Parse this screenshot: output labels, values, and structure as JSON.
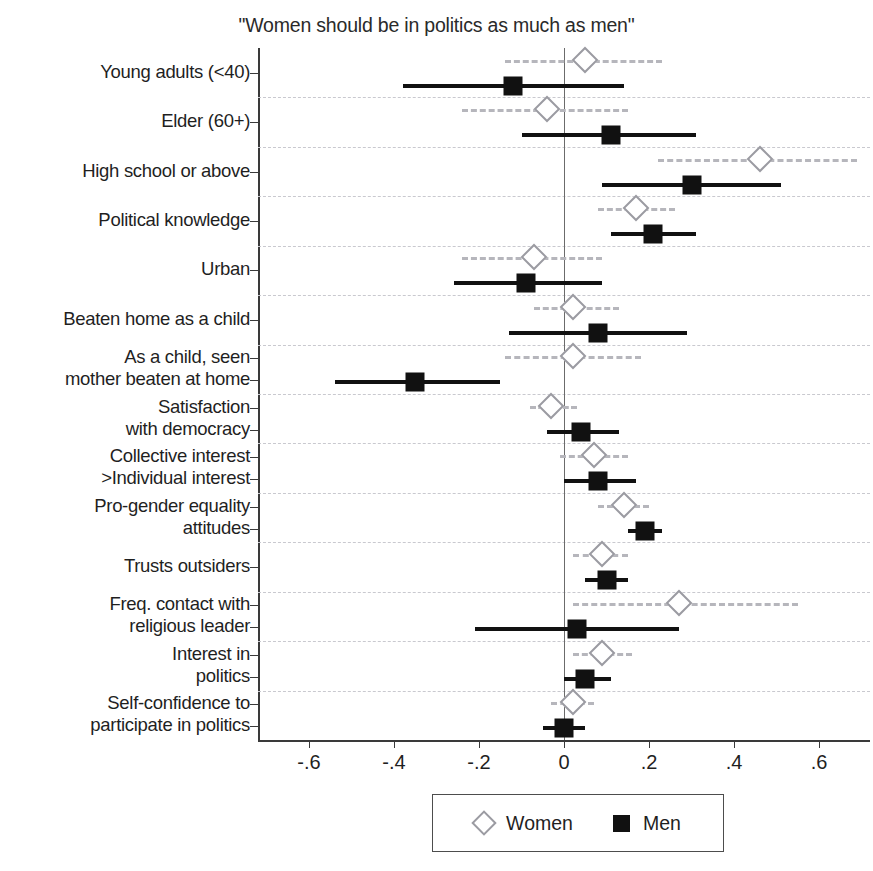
{
  "chart_data": {
    "type": "scatter",
    "title": "\"Women should be in politics as much as men\"",
    "xlabel": "",
    "ylabel": "",
    "xlim": [
      -0.72,
      0.72
    ],
    "xticks": [
      -0.6,
      -0.4,
      -0.2,
      0,
      0.2,
      0.4,
      0.6
    ],
    "xticklabels": [
      "-.6",
      "-.4",
      "-.2",
      "0",
      ".2",
      ".4",
      ".6"
    ],
    "grid": true,
    "grid_style": "dashed horizontal",
    "zero_reference_line": 0,
    "legend": {
      "position": "bottom-center",
      "entries": [
        {
          "label": "Women",
          "marker": "open-diamond"
        },
        {
          "label": "Men",
          "marker": "filled-square"
        }
      ]
    },
    "categories": [
      "Young adults (<40)",
      "Elder (60+)",
      "High school or above",
      "Political knowledge",
      "Urban",
      "Beaten home as a child",
      "As a child, seen\nmother beaten at home",
      "Satisfaction\nwith democracy",
      "Collective interest\n>Individual interest",
      "Pro-gender equality\nattitudes",
      "Trusts outsiders",
      "Freq. contact with\nreligious leader",
      "Interest in\npolitics",
      "Self-confidence to\nparticipate in politics"
    ],
    "series": [
      {
        "name": "Women",
        "marker": "open-diamond",
        "color": "#9b9ba2",
        "ci_style": "dashed",
        "values": [
          0.05,
          -0.04,
          0.46,
          0.17,
          -0.07,
          0.02,
          0.02,
          -0.03,
          0.07,
          0.14,
          0.09,
          0.27,
          0.09,
          0.02
        ],
        "ci_low": [
          -0.14,
          -0.24,
          0.22,
          0.08,
          -0.24,
          -0.07,
          -0.14,
          -0.08,
          -0.01,
          0.08,
          0.02,
          0.02,
          0.02,
          -0.03
        ],
        "ci_high": [
          0.23,
          0.15,
          0.69,
          0.26,
          0.09,
          0.13,
          0.18,
          0.03,
          0.15,
          0.2,
          0.15,
          0.55,
          0.16,
          0.07
        ]
      },
      {
        "name": "Men",
        "marker": "filled-square",
        "color": "#111111",
        "ci_style": "solid",
        "values": [
          -0.12,
          0.11,
          0.3,
          0.21,
          -0.09,
          0.08,
          -0.35,
          0.04,
          0.08,
          0.19,
          0.1,
          0.03,
          0.05,
          0.0
        ],
        "ci_low": [
          -0.38,
          -0.1,
          0.09,
          0.11,
          -0.26,
          -0.13,
          -0.54,
          -0.04,
          0.0,
          0.15,
          0.05,
          -0.21,
          0.0,
          -0.05
        ],
        "ci_high": [
          0.14,
          0.31,
          0.51,
          0.31,
          0.09,
          0.29,
          -0.15,
          0.13,
          0.17,
          0.23,
          0.15,
          0.27,
          0.11,
          0.05
        ]
      }
    ]
  },
  "legend": {
    "women_label": "Women",
    "men_label": "Men"
  }
}
